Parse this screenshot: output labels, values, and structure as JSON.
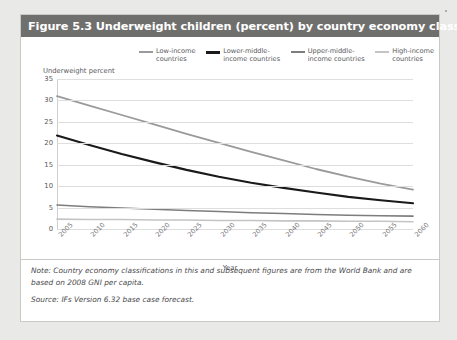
{
  "figure": {
    "title": "Figure 5.3 Underweight children (percent) by country economy classification",
    "note": "Note: Country economy classifications in this and subsequent figures are from the World Bank and are based on 2008 GNI per capita.",
    "source": "Source: IFs Version 6.32 base case forecast."
  },
  "chart_data": {
    "type": "line",
    "title": "Underweight children (percent) by country economy classification",
    "xlabel": "Year",
    "ylabel": "Underweight percent",
    "xlim": [
      2005,
      2060
    ],
    "ylim": [
      0,
      35
    ],
    "yticks": [
      0,
      5,
      10,
      15,
      20,
      25,
      30,
      35
    ],
    "xticks": [
      2005,
      2010,
      2015,
      2020,
      2025,
      2030,
      2035,
      2040,
      2045,
      2050,
      2055,
      2060
    ],
    "grid": true,
    "legend_position": "top",
    "x": [
      2005,
      2010,
      2015,
      2020,
      2025,
      2030,
      2035,
      2040,
      2045,
      2050,
      2055,
      2060
    ],
    "series": [
      {
        "name": "Low-income\ncountries",
        "color": "#9a9a9a",
        "width": 1.8,
        "values": [
          31.0,
          28.8,
          26.6,
          24.4,
          22.2,
          20.1,
          18.0,
          16.0,
          14.0,
          12.2,
          10.6,
          9.2
        ]
      },
      {
        "name": "Lower-middle-\nincome countries",
        "color": "#1a1a1a",
        "width": 2.1,
        "values": [
          21.8,
          19.6,
          17.5,
          15.6,
          13.8,
          12.2,
          10.8,
          9.6,
          8.5,
          7.5,
          6.7,
          6.0
        ]
      },
      {
        "name": "Upper-middle-\nincome countries",
        "color": "#7d7d7d",
        "width": 1.6,
        "values": [
          5.6,
          5.2,
          4.9,
          4.6,
          4.3,
          4.1,
          3.8,
          3.6,
          3.4,
          3.2,
          3.1,
          3.0
        ]
      },
      {
        "name": "High-income\ncountries",
        "color": "#c4c4c4",
        "width": 1.6,
        "values": [
          2.3,
          2.2,
          2.2,
          2.1,
          2.1,
          2.0,
          2.0,
          1.9,
          1.9,
          1.8,
          1.8,
          1.7
        ]
      }
    ]
  }
}
